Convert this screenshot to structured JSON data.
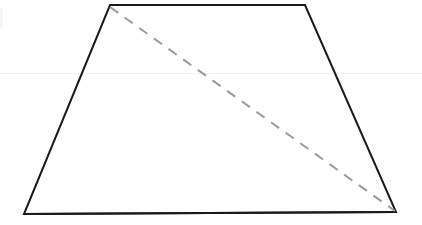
{
  "figure": {
    "shape_name": "trapezoid",
    "canvas": {
      "width": 422,
      "height": 225,
      "background": "#ffffff"
    },
    "vertices": {
      "top_left": {
        "label": "top-left vertex",
        "x": 110,
        "y": 5
      },
      "top_right": {
        "label": "top-right vertex",
        "x": 305,
        "y": 5
      },
      "bottom_right": {
        "label": "bottom-right vertex",
        "x": 396,
        "y": 212
      },
      "bottom_left": {
        "label": "bottom-left vertex",
        "x": 24,
        "y": 214
      }
    },
    "outline": {
      "points": "110,5 305,5 396,212 24,214",
      "stroke": "#1a1a1a",
      "stroke_width": 2,
      "fill": "none",
      "style": "solid"
    },
    "diagonal": {
      "label": "dashed diagonal from top-left to bottom-right",
      "x1": 110,
      "y1": 7,
      "x2": 395,
      "y2": 211,
      "stroke": "#9a9a9a",
      "stroke_width": 2,
      "style": "dashed",
      "dash_pattern": "10 8"
    },
    "edges": [
      {
        "name": "top-edge",
        "from": "top_left",
        "to": "top_right",
        "style": "solid"
      },
      {
        "name": "right-edge",
        "from": "top_right",
        "to": "bottom_right",
        "style": "solid"
      },
      {
        "name": "bottom-edge",
        "from": "bottom_right",
        "to": "bottom_left",
        "style": "solid"
      },
      {
        "name": "left-edge",
        "from": "bottom_left",
        "to": "top_left",
        "style": "solid"
      }
    ],
    "artifacts": {
      "horizontal_scan_line": {
        "label": "faint horizontal scan line",
        "y": 73,
        "color": "#f1f1f1"
      },
      "left_edge_smudge": {
        "label": "faint left edge smudge",
        "color": "#f6f6f6"
      }
    }
  },
  "chart_data": {
    "type": "diagram",
    "xlabel": "",
    "ylabel": "",
    "elements": [
      {
        "type": "polygon",
        "name": "trapezoid-outline",
        "points": [
          [
            110,
            5
          ],
          [
            305,
            5
          ],
          [
            396,
            212
          ],
          [
            24,
            214
          ]
        ],
        "stroke": "#1a1a1a",
        "style": "solid"
      },
      {
        "type": "line",
        "name": "diagonal",
        "points": [
          [
            110,
            7
          ],
          [
            395,
            211
          ]
        ],
        "stroke": "#9a9a9a",
        "style": "dashed"
      }
    ]
  }
}
